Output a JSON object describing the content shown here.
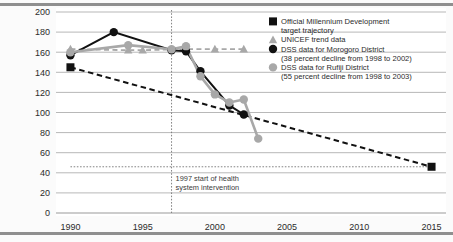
{
  "figure": {
    "background_color": "#fbfbfb",
    "plot_background_color": "#ffffff",
    "border_color": "#8f8f8f"
  },
  "colors": {
    "target": "#111111",
    "morogoro": "#111111",
    "unicef": "#a8a8a8",
    "rufiji": "#a8a8a8",
    "gridline": "#9a9a9a",
    "axis": "#6e6e6e",
    "intervention_line": "#777777"
  },
  "chart_data": {
    "type": "line",
    "title": "",
    "xlabel": "",
    "ylabel": "",
    "xlim": [
      1989,
      2016
    ],
    "ylim": [
      0,
      200
    ],
    "grid": true,
    "legend_position": "top-right",
    "x_ticks": [
      "1990",
      "1995",
      "2000",
      "2005",
      "2010",
      "2015"
    ],
    "x_tick_values": [
      1990,
      1995,
      2000,
      2005,
      2010,
      2015
    ],
    "y_ticks": [
      "0",
      "20",
      "40",
      "60",
      "80",
      "100",
      "120",
      "140",
      "160",
      "180",
      "200"
    ],
    "y_tick_values": [
      0,
      20,
      40,
      60,
      80,
      100,
      120,
      140,
      160,
      180,
      200
    ],
    "series": [
      {
        "name": "Official Millennium Development target trajectory",
        "key": "target",
        "marker": "square",
        "color": "#111111",
        "line_style": "dashed",
        "points": [
          {
            "x": 1990,
            "y": 145
          },
          {
            "x": 2015,
            "y": 46
          }
        ]
      },
      {
        "name": "UNICEF trend data",
        "key": "unicef",
        "marker": "triangle",
        "color": "#a8a8a8",
        "line_style": "dashed",
        "points": [
          {
            "x": 1990,
            "y": 163
          },
          {
            "x": 1994,
            "y": 162
          },
          {
            "x": 1995,
            "y": 162
          },
          {
            "x": 1998,
            "y": 163
          },
          {
            "x": 2000,
            "y": 163
          },
          {
            "x": 2002,
            "y": 163
          }
        ]
      },
      {
        "name": "DSS data for Morogoro District",
        "sublabel": "(38 percent decline from 1998 to 2002)",
        "key": "morogoro",
        "marker": "circle",
        "color": "#111111",
        "line_style": "solid",
        "points": [
          {
            "x": 1990,
            "y": 157
          },
          {
            "x": 1993,
            "y": 180
          },
          {
            "x": 1997,
            "y": 162
          },
          {
            "x": 1998,
            "y": 161
          },
          {
            "x": 1999,
            "y": 141
          },
          {
            "x": 2001,
            "y": 107
          },
          {
            "x": 2002,
            "y": 98
          }
        ]
      },
      {
        "name": "DSS data for Rufiji District",
        "sublabel": "(55 percent decline from 1998 to 2003)",
        "key": "rufiji",
        "marker": "circle",
        "color": "#a8a8a8",
        "line_style": "solid",
        "points": [
          {
            "x": 1990,
            "y": 160
          },
          {
            "x": 1994,
            "y": 167
          },
          {
            "x": 1997,
            "y": 163
          },
          {
            "x": 1998,
            "y": 166
          },
          {
            "x": 1999,
            "y": 136
          },
          {
            "x": 2000,
            "y": 118
          },
          {
            "x": 2001,
            "y": 110
          },
          {
            "x": 2002,
            "y": 113
          },
          {
            "x": 2003,
            "y": 74
          }
        ]
      }
    ],
    "annotations": [
      {
        "id": "intervention",
        "type": "vline",
        "x": 1997,
        "line_style": "dotted",
        "text_line1": "1997 start of health",
        "text_line2": "system intervention"
      },
      {
        "id": "target-level",
        "type": "hline",
        "y": 46,
        "line_style": "dotted",
        "x_from": 1990,
        "x_to": 2015
      }
    ]
  },
  "legend": {
    "entries": [
      {
        "marker": "square",
        "color": "#111111",
        "line1": "Official Millennium Development",
        "line2": "target trajectory"
      },
      {
        "marker": "triangle",
        "color": "#a8a8a8",
        "line1": "UNICEF trend data",
        "line2": ""
      },
      {
        "marker": "circle",
        "color": "#111111",
        "line1": "DSS data for Morogoro District",
        "line2": "(38 percent decline from 1998 to 2002)"
      },
      {
        "marker": "circle",
        "color": "#a8a8a8",
        "line1": "DSS data for Rufiji District",
        "line2": "(55 percent decline from 1998 to 2003)"
      }
    ]
  }
}
